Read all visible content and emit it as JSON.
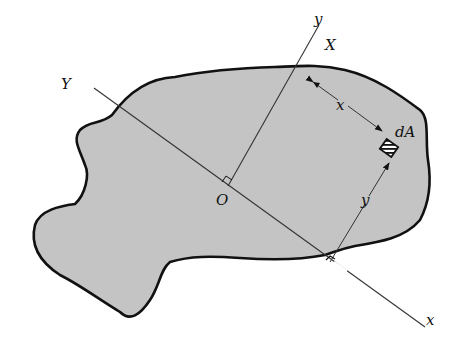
{
  "figure": {
    "colors": {
      "fill": "#c4c4c4",
      "outline": "#111111",
      "axis_line": "#333333",
      "background": "#ffffff"
    },
    "labels": {
      "y_axis": "y",
      "X_axis": "X",
      "Y_axis": "Y",
      "x_axis": "x",
      "origin": "O",
      "element": "dA",
      "dim_x": "x",
      "dim_y": "y"
    }
  }
}
